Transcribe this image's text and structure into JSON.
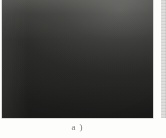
{
  "figure": {
    "caption": "a )",
    "panel_label": "a",
    "photo": {
      "alt_name": "wire-mesh-net-photograph",
      "subject": "diamond-pattern wire mesh net in perspective",
      "rendering": "grayscale halftone scan",
      "colors": {
        "wire_highlight": "#f2f2ec",
        "wire_midtone": "#d4d4ce",
        "background_dark": "#2c2c2a",
        "background_light": "#5a5a58",
        "page_background": "#fdfdfc",
        "frame_border": "#b8b8b4"
      },
      "geometry": {
        "mesh_type": "diamond",
        "strand_angle_degrees": 62,
        "perspective_tilt_degrees": 63,
        "cell_pitch_px": 14.2
      }
    },
    "adjacent_panel": {
      "name": "next-figure-sliver",
      "visible_width_px": 5
    }
  }
}
